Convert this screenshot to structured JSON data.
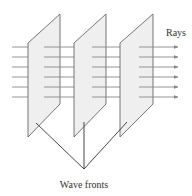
{
  "diagram": {
    "labels": {
      "rays": "Rays",
      "wave_fronts": "Wave fronts"
    },
    "wave_front_count": 3,
    "ray_count": 6,
    "colors": {
      "plane_fill": "#efefef",
      "plane_stroke": "#666666",
      "ray": "#888888",
      "pointer": "#333333"
    }
  }
}
